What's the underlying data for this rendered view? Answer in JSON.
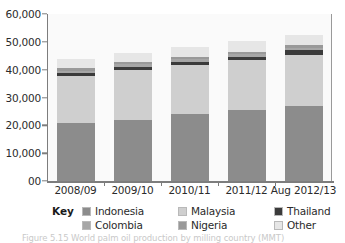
{
  "chart_data": {
    "type": "bar",
    "subtype": "stacked-bar",
    "title": "",
    "xlabel": "",
    "ylabel": "",
    "categories": [
      "2008/09",
      "2009/10",
      "2010/11",
      "2011/12",
      "Aug 2012/13"
    ],
    "series": [
      {
        "name": "Indonesia",
        "color": "#8c8c8c",
        "values": [
          20700,
          22000,
          23900,
          25400,
          27100
        ]
      },
      {
        "name": "Malaysia",
        "color": "#cfcfcf",
        "values": [
          17100,
          17900,
          17800,
          18000,
          18300
        ]
      },
      {
        "name": "Thailand",
        "color": "#3b3b3b",
        "values": [
          1100,
          1200,
          1200,
          1300,
          1500
        ]
      },
      {
        "name": "Colombia",
        "color": "#a6a6a6",
        "values": [
          800,
          800,
          900,
          900,
          900
        ]
      },
      {
        "name": "Nigeria",
        "color": "#999999",
        "values": [
          850,
          850,
          850,
          900,
          900
        ]
      },
      {
        "name": "Other",
        "color": "#e6e6e6",
        "values": [
          3450,
          3250,
          3550,
          3800,
          3800
        ]
      }
    ],
    "totals": [
      44000,
      46000,
      48200,
      50300,
      52500
    ],
    "ylim": [
      0,
      60000
    ],
    "ytick_values": [
      0,
      10000,
      20000,
      30000,
      40000,
      50000,
      60000
    ],
    "ytick_labels": [
      "00",
      "10,000",
      "20,000",
      "30,000",
      "40,000",
      "50,000",
      "60,000"
    ],
    "grid": false,
    "legend_position": "bottom"
  },
  "legend": {
    "key_label": "Key",
    "rows": [
      [
        {
          "label": "Indonesia",
          "color": "#8c8c8c"
        },
        {
          "label": "Malaysia",
          "color": "#cfcfcf"
        },
        {
          "label": "Thailand",
          "color": "#3b3b3b"
        }
      ],
      [
        {
          "label": "Colombia",
          "color": "#a6a6a6"
        },
        {
          "label": "Nigeria",
          "color": "#999999"
        },
        {
          "label": "Other",
          "color": "#e6e6e6"
        }
      ]
    ]
  },
  "caption": {
    "text": "Figure 5.15 World palm oil production by milling country (MMT)"
  }
}
